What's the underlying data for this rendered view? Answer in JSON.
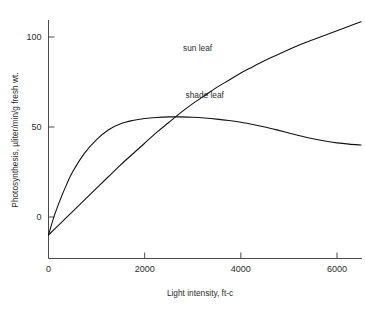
{
  "chart_data": {
    "type": "line",
    "title": "",
    "xlabel": "Light intensity, ft-c",
    "ylabel": "Photosynthesis, µliter/min/g fresh wt.",
    "xlim": [
      0,
      6600
    ],
    "ylim": [
      -16,
      115
    ],
    "xticks": [
      0,
      2000,
      4000,
      6000
    ],
    "xticklabels": [
      "0",
      "2000",
      "4000",
      "6000"
    ],
    "yticks": [
      0,
      50,
      100
    ],
    "yticklabels": [
      "0",
      "50",
      "100"
    ],
    "grid": false,
    "legend_position": "inline-annotations",
    "line_color": "#111111",
    "axis_color": "#4a4a4a",
    "background": "#ffffff",
    "series": [
      {
        "name": "sun leaf",
        "label_x": 3100,
        "label_y": 92,
        "x": [
          0,
          250,
          500,
          750,
          1000,
          1250,
          1500,
          1750,
          2000,
          2250,
          2500,
          2750,
          3000,
          3250,
          3500,
          3750,
          4000,
          4250,
          4500,
          4750,
          5000,
          5250,
          5500,
          5750,
          6000,
          6250,
          6500
        ],
        "y": [
          -10,
          -3.5,
          3,
          9.5,
          16,
          22.5,
          29,
          35,
          41,
          47,
          52.5,
          58,
          63,
          67.5,
          72,
          76,
          80,
          83.5,
          87,
          90,
          93,
          96,
          98.5,
          101,
          103.5,
          106,
          108.5
        ]
      },
      {
        "name": "shade leaf",
        "label_x": 3250,
        "label_y": 66,
        "x": [
          0,
          125,
          250,
          375,
          500,
          750,
          1000,
          1250,
          1500,
          1750,
          2000,
          2250,
          2500,
          2750,
          3000,
          3250,
          3500,
          3750,
          4000,
          4250,
          4500,
          4750,
          5000,
          5250,
          5500,
          5750,
          6000,
          6250,
          6500
        ],
        "y": [
          -10,
          1,
          10,
          18,
          25,
          35.5,
          43,
          48.5,
          51.8,
          53.6,
          54.7,
          55.3,
          55.6,
          55.6,
          55.4,
          55.0,
          54.4,
          53.6,
          52.6,
          51.4,
          50.0,
          48.4,
          46.7,
          45.0,
          43.5,
          42.2,
          41.2,
          40.5,
          40.0
        ]
      }
    ],
    "annotations": [
      {
        "text": "sun leaf",
        "x": 3100,
        "y": 92
      },
      {
        "text": "shade leaf",
        "x": 3250,
        "y": 66
      }
    ]
  }
}
